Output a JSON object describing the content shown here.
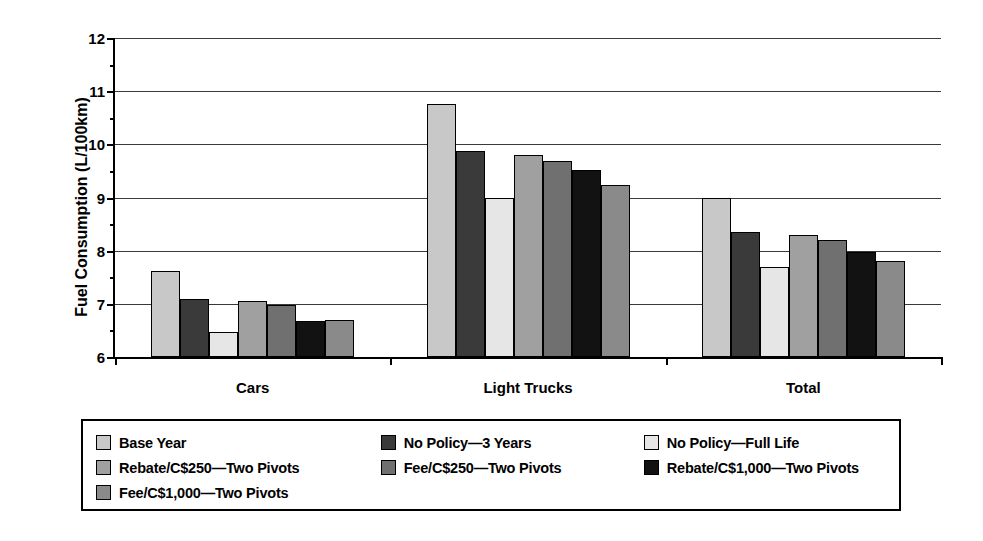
{
  "chart_data": {
    "type": "bar",
    "title": "",
    "xlabel": "",
    "ylabel": "Fuel Consumption (L/100km)",
    "ylim": [
      6,
      12
    ],
    "yticks": [
      6,
      7,
      8,
      9,
      10,
      11,
      12
    ],
    "ytick_labels": [
      "6",
      "7",
      "8",
      "9",
      "10",
      "11",
      "12"
    ],
    "grid": true,
    "legend_position": "bottom",
    "categories": [
      "Cars",
      "Light Trucks",
      "Total"
    ],
    "series": [
      {
        "name": "Base Year",
        "color": "#c8c8c8",
        "values": [
          7.62,
          10.75,
          9.0
        ]
      },
      {
        "name": "No Policy—3 Years",
        "color": "#3a3a3a",
        "values": [
          7.1,
          9.88,
          8.35
        ]
      },
      {
        "name": "No Policy—Full Life",
        "color": "#e6e6e6",
        "values": [
          6.47,
          9.0,
          7.7
        ]
      },
      {
        "name": "Rebate/C$250—Two Pivots",
        "color": "#a0a0a0",
        "values": [
          7.05,
          9.8,
          8.3
        ]
      },
      {
        "name": "Fee/C$250—Two Pivots",
        "color": "#707070",
        "values": [
          6.97,
          9.68,
          8.2
        ]
      },
      {
        "name": "Rebate/C$1,000—Two Pivots",
        "color": "#121212",
        "values": [
          6.68,
          9.52,
          7.97
        ]
      },
      {
        "name": "Fee/C$1,000—Two Pivots",
        "color": "#8a8a8a",
        "values": [
          6.7,
          9.23,
          7.81
        ]
      }
    ]
  },
  "legend": {
    "rows": [
      [
        {
          "label": "Base Year",
          "color": "#c8c8c8"
        },
        {
          "label": "No Policy—3 Years",
          "color": "#3a3a3a"
        },
        {
          "label": "No Policy—Full Life",
          "color": "#e6e6e6"
        }
      ],
      [
        {
          "label": "Rebate/C$250—Two Pivots",
          "color": "#a0a0a0"
        },
        {
          "label": "Fee/C$250—Two Pivots",
          "color": "#707070"
        },
        {
          "label": "Rebate/C$1,000—Two Pivots",
          "color": "#121212"
        }
      ],
      [
        {
          "label": "Fee/C$1,000—Two Pivots",
          "color": "#8a8a8a"
        }
      ]
    ]
  }
}
